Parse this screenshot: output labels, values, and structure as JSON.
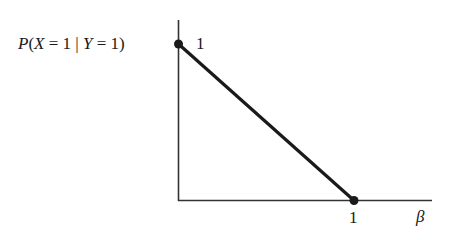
{
  "diagram": {
    "y_axis_label": "P(X = 1 | Y = 1)",
    "y_tick_label": "1",
    "x_tick_label": "1",
    "x_axis_label": "β",
    "line": {
      "from": {
        "beta": 0,
        "p": 1
      },
      "to": {
        "beta": 1,
        "p": 0
      },
      "color": "#1a1a1a"
    },
    "axis_color": "#333333"
  }
}
